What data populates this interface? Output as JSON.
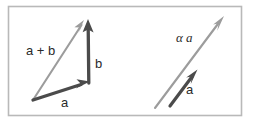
{
  "figure": {
    "name": "vector-operations-figure",
    "background_color": "#ffffff",
    "frame": {
      "name": "figure-frame",
      "x": 8,
      "y": 6,
      "width": 234,
      "height": 110,
      "stroke": "#b9b9b9",
      "fill": "#ffffff"
    },
    "panels": [
      {
        "name": "vector-addition-panel",
        "title": "vector addition",
        "labels": [
          {
            "name": "label-a-plus-b",
            "text": "a + b",
            "x": 26,
            "y": 54,
            "color": "#2f2f2f"
          },
          {
            "name": "label-b",
            "text": "b",
            "x": 95,
            "y": 68,
            "color": "#2f2f2f"
          },
          {
            "name": "label-a",
            "text": "a",
            "x": 62,
            "y": 107,
            "color": "#2f2f2f"
          }
        ],
        "vectors": [
          {
            "name": "vector-a-plus-b",
            "label": "a + b",
            "from": [
              33,
              100
            ],
            "to": [
              84,
              21
            ],
            "color": "#9a9a9a",
            "stroke_width": 2.2
          },
          {
            "name": "vector-a",
            "label": "a",
            "from": [
              33,
              100
            ],
            "to": [
              89,
              82
            ],
            "color": "#4a4a4a",
            "stroke_width": 3.4
          },
          {
            "name": "vector-b",
            "label": "b",
            "from": [
              89,
              82
            ],
            "to": [
              88,
              20
            ],
            "color": "#4a4a4a",
            "stroke_width": 3.4
          }
        ]
      },
      {
        "name": "scalar-multiplication-panel",
        "title": "scalar multiplication",
        "labels": [
          {
            "name": "label-alpha-a",
            "text": "α a",
            "x": 176,
            "y": 42,
            "color": "#2f2f2f"
          },
          {
            "name": "label-a-right",
            "text": "a",
            "x": 186,
            "y": 94,
            "color": "#2f2f2f"
          }
        ],
        "vectors": [
          {
            "name": "vector-alpha-a",
            "label": "α a",
            "from": [
              155,
              108
            ],
            "to": [
              224,
              17
            ],
            "color": "#9a9a9a",
            "stroke_width": 2.2
          },
          {
            "name": "vector-a-scaled-base",
            "label": "a",
            "from": [
              170,
              106
            ],
            "to": [
              197,
              70
            ],
            "color": "#4a4a4a",
            "stroke_width": 3.4
          }
        ]
      }
    ]
  }
}
